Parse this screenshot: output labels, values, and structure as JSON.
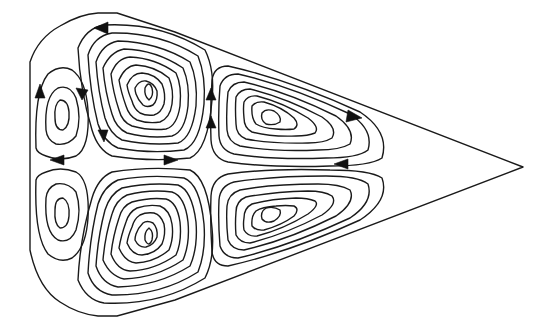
{
  "figure": {
    "colors": {
      "line": "#1a1a1a",
      "background": "#ffffff"
    },
    "boundary": {
      "left_wall_x": 30,
      "tip": [
        523,
        167
      ],
      "top_cap": [
        [
          30,
          62
        ],
        [
          52,
          32
        ],
        [
          95,
          13
        ],
        [
          117,
          13
        ],
        [
          170,
          30
        ],
        [
          523,
          167
        ]
      ],
      "bottom_cap": [
        [
          30,
          250
        ],
        [
          52,
          290
        ],
        [
          95,
          315
        ],
        [
          117,
          315
        ],
        [
          170,
          302
        ],
        [
          523,
          167
        ]
      ]
    },
    "cells": [
      {
        "id": "upper-left",
        "center": [
          62,
          118
        ],
        "rx": [
          8,
          20,
          30
        ],
        "ry": [
          16,
          32,
          46
        ],
        "arrows": 4
      },
      {
        "id": "upper-middle",
        "center": [
          150,
          78
        ],
        "contours": 9,
        "arrows": 3
      },
      {
        "id": "upper-right",
        "center": [
          270,
          118
        ],
        "contours": 7,
        "arrows": 4
      },
      {
        "id": "lower-left",
        "center": [
          62,
          210
        ],
        "contours": 3,
        "arrows": 0
      },
      {
        "id": "lower-middle",
        "center": [
          150,
          248
        ],
        "contours": 9,
        "arrows": 0
      },
      {
        "id": "lower-right",
        "center": [
          270,
          213
        ],
        "contours": 7,
        "arrows": 0
      }
    ]
  }
}
